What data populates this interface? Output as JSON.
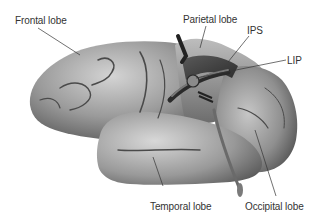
{
  "diagram": {
    "labels": [
      {
        "id": "frontal",
        "text": "Frontal lobe",
        "x": 15,
        "y": 15
      },
      {
        "id": "parietal",
        "text": "Parietal lobe",
        "x": 183,
        "y": 14
      },
      {
        "id": "ips",
        "text": "IPS",
        "x": 247,
        "y": 25
      },
      {
        "id": "lip",
        "text": "LIP",
        "x": 287,
        "y": 55
      },
      {
        "id": "temporal",
        "text": "Temporal lobe",
        "x": 150,
        "y": 201
      },
      {
        "id": "occipital",
        "text": "Occipital lobe",
        "x": 245,
        "y": 201
      }
    ],
    "colors": {
      "background": "#ffffff",
      "brain_light": "#c8c8c8",
      "brain_mid": "#8e8e8e",
      "brain_dark": "#3a3a3a",
      "leader_line": "#333333",
      "label_text": "#333333"
    }
  }
}
